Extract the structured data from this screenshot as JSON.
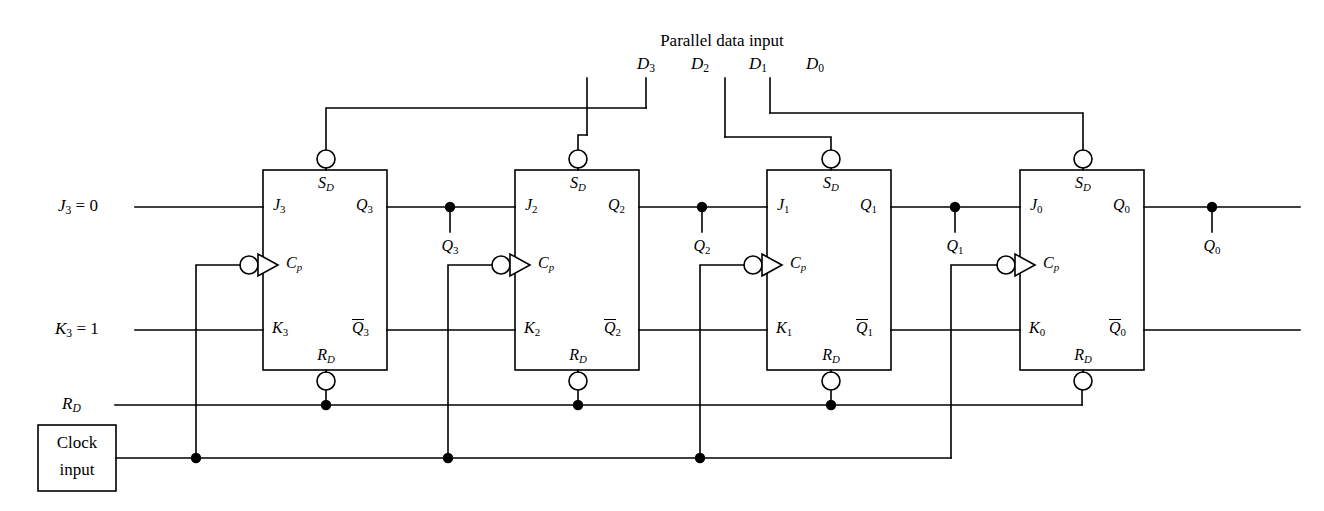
{
  "diagram": {
    "top_label": "Parallel data input",
    "data_inputs": [
      {
        "name": "D3",
        "base": "D",
        "sub": "3"
      },
      {
        "name": "D2",
        "base": "D",
        "sub": "2"
      },
      {
        "name": "D1",
        "base": "D",
        "sub": "1"
      },
      {
        "name": "D0",
        "base": "D",
        "sub": "0"
      }
    ],
    "left_inputs": [
      {
        "name": "J3-input",
        "base": "J",
        "sub": "3",
        "value": "= 0",
        "full": "J3 = 0"
      },
      {
        "name": "K3-input",
        "base": "K",
        "sub": "3",
        "value": "= 1",
        "full": "K3 = 1"
      },
      {
        "name": "RD-input",
        "base": "R",
        "sub": "D",
        "value": "",
        "full": "RD"
      }
    ],
    "clock_box": {
      "line1": "Clock",
      "line2": "input"
    },
    "flipflops": [
      {
        "id": "ff3",
        "j": {
          "base": "J",
          "sub": "3"
        },
        "k": {
          "base": "K",
          "sub": "3"
        },
        "cp": {
          "base": "C",
          "sub": "p"
        },
        "sd": {
          "base": "S",
          "sub": "D"
        },
        "rd": {
          "base": "R",
          "sub": "D"
        },
        "q": {
          "base": "Q",
          "sub": "3"
        },
        "qbar": {
          "base": "Q",
          "sub": "3"
        },
        "tap": {
          "base": "Q",
          "sub": "3"
        }
      },
      {
        "id": "ff2",
        "j": {
          "base": "J",
          "sub": "2"
        },
        "k": {
          "base": "K",
          "sub": "2"
        },
        "cp": {
          "base": "C",
          "sub": "p"
        },
        "sd": {
          "base": "S",
          "sub": "D"
        },
        "rd": {
          "base": "R",
          "sub": "D"
        },
        "q": {
          "base": "Q",
          "sub": "2"
        },
        "qbar": {
          "base": "Q",
          "sub": "2"
        },
        "tap": {
          "base": "Q",
          "sub": "2"
        }
      },
      {
        "id": "ff1",
        "j": {
          "base": "J",
          "sub": "1"
        },
        "k": {
          "base": "K",
          "sub": "1"
        },
        "cp": {
          "base": "C",
          "sub": "p"
        },
        "sd": {
          "base": "S",
          "sub": "D"
        },
        "rd": {
          "base": "R",
          "sub": "D"
        },
        "q": {
          "base": "Q",
          "sub": "1"
        },
        "qbar": {
          "base": "Q",
          "sub": "1"
        },
        "tap": {
          "base": "Q",
          "sub": "1"
        }
      },
      {
        "id": "ff0",
        "j": {
          "base": "J",
          "sub": "0"
        },
        "k": {
          "base": "K",
          "sub": "0"
        },
        "cp": {
          "base": "C",
          "sub": "p"
        },
        "sd": {
          "base": "S",
          "sub": "D"
        },
        "rd": {
          "base": "R",
          "sub": "D"
        },
        "q": {
          "base": "Q",
          "sub": "0"
        },
        "qbar": {
          "base": "Q",
          "sub": "0"
        },
        "tap": {
          "base": "Q",
          "sub": "0"
        }
      }
    ],
    "colors": {
      "line": "#000000",
      "background": "#ffffff",
      "text": "#000000"
    }
  }
}
